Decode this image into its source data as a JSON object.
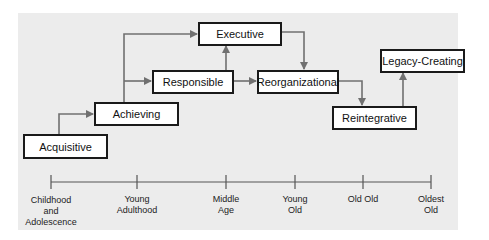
{
  "diagram": {
    "type": "stage-progression",
    "stages": [
      {
        "id": "acquisitive",
        "label": "Acquisitive"
      },
      {
        "id": "achieving",
        "label": "Achieving"
      },
      {
        "id": "responsible",
        "label": "Responsible"
      },
      {
        "id": "executive",
        "label": "Executive"
      },
      {
        "id": "reorganizational",
        "label": "Reorganizational"
      },
      {
        "id": "reintegrative",
        "label": "Reintegrative"
      },
      {
        "id": "legacy",
        "label": "Legacy-Creating"
      }
    ],
    "edges": [
      [
        "acquisitive",
        "achieving"
      ],
      [
        "achieving",
        "responsible"
      ],
      [
        "achieving",
        "executive"
      ],
      [
        "responsible",
        "executive"
      ],
      [
        "responsible",
        "reorganizational"
      ],
      [
        "executive",
        "reorganizational"
      ],
      [
        "reorganizational",
        "reintegrative"
      ],
      [
        "reintegrative",
        "legacy"
      ]
    ],
    "timeline": [
      {
        "label": "Childhood\nand\nAdolescence",
        "lines": [
          "Childhood",
          "and",
          "Adolescence"
        ]
      },
      {
        "label": "Young\nAdulthood",
        "lines": [
          "Young",
          "Adulthood"
        ]
      },
      {
        "label": "Middle\nAge",
        "lines": [
          "Middle",
          "Age"
        ]
      },
      {
        "label": "Young\nOld",
        "lines": [
          "Young",
          "Old"
        ]
      },
      {
        "label": "Old Old",
        "lines": [
          "Old Old"
        ]
      },
      {
        "label": "Oldest\nOld",
        "lines": [
          "Oldest",
          "Old"
        ]
      }
    ]
  },
  "colors": {
    "background_panel": "#ececec",
    "box_border": "#1a1a1a",
    "arrow": "#707070",
    "timeline": "#555555"
  }
}
